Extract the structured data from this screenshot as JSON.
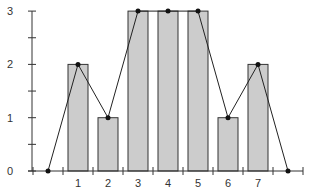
{
  "chart_data": {
    "type": "bar",
    "title": "",
    "xlabel": "",
    "ylabel": "",
    "categories": [
      "1",
      "2",
      "3",
      "4",
      "5",
      "6",
      "7"
    ],
    "series": [
      {
        "name": "bars",
        "type": "bar",
        "x": [
          1,
          2,
          3,
          4,
          5,
          6,
          7
        ],
        "values": [
          2,
          1,
          3,
          3,
          3,
          1,
          2
        ]
      },
      {
        "name": "line",
        "type": "line",
        "x": [
          0,
          1,
          2,
          3,
          4,
          5,
          6,
          7,
          8
        ],
        "values": [
          0,
          2,
          1,
          3,
          3,
          3,
          1,
          2,
          0
        ]
      }
    ],
    "ylim": [
      0,
      3
    ],
    "xlim": [
      -1,
      9
    ],
    "yticks_major": [
      0,
      1,
      2,
      3
    ],
    "yticks_minor": [
      0.5,
      1.5,
      2.5
    ],
    "ytick_labels": [
      "0",
      "1",
      "2",
      "3"
    ],
    "xticks": [
      -0.5,
      0.5,
      1.5,
      2.5,
      3.5,
      4.5,
      5.5,
      6.5,
      7.5,
      8.5
    ],
    "xtick_labels": [
      "1",
      "2",
      "3",
      "4",
      "5",
      "6",
      "7"
    ],
    "grid": false,
    "legend": "none",
    "colors": {
      "bar_fill": "#cccccc",
      "bar_stroke": "#333333",
      "line": "#222222",
      "marker": "#111111",
      "axis": "#333333"
    }
  }
}
